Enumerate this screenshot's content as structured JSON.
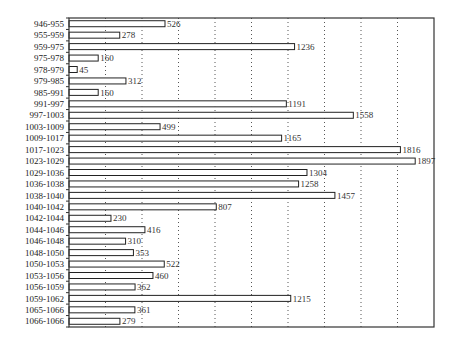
{
  "chart_data": {
    "type": "bar",
    "orientation": "horizontal",
    "title": "",
    "xlabel": "",
    "ylabel": "",
    "categories": [
      "946-955",
      "955-959",
      "959-975",
      "975-978",
      "978-979",
      "979-985",
      "985-991",
      "991-997",
      "997-1003",
      "1003-1009",
      "1009-1017",
      "1017-1023",
      "1023-1029",
      "1029-1036",
      "1036-1038",
      "1038-1040",
      "1040-1042",
      "1042-1044",
      "1044-1046",
      "1046-1048",
      "1048-1050",
      "1050-1053",
      "1053-1056",
      "1056-1059",
      "1059-1062",
      "1065-1066",
      "1066-1066"
    ],
    "values": [
      526,
      278,
      1236,
      160,
      45,
      312,
      160,
      1191,
      1558,
      499,
      1165,
      1816,
      1897,
      1304,
      1258,
      1457,
      807,
      230,
      416,
      310,
      353,
      522,
      460,
      362,
      1215,
      361,
      279
    ],
    "xlim": [
      0,
      2000
    ],
    "grid_step": 200,
    "grid": "vertical-dotted",
    "legend": "none",
    "data_labels": true,
    "bar_fill": "#ffffff",
    "bar_stroke": "#222222",
    "grid_color": "#555555"
  }
}
